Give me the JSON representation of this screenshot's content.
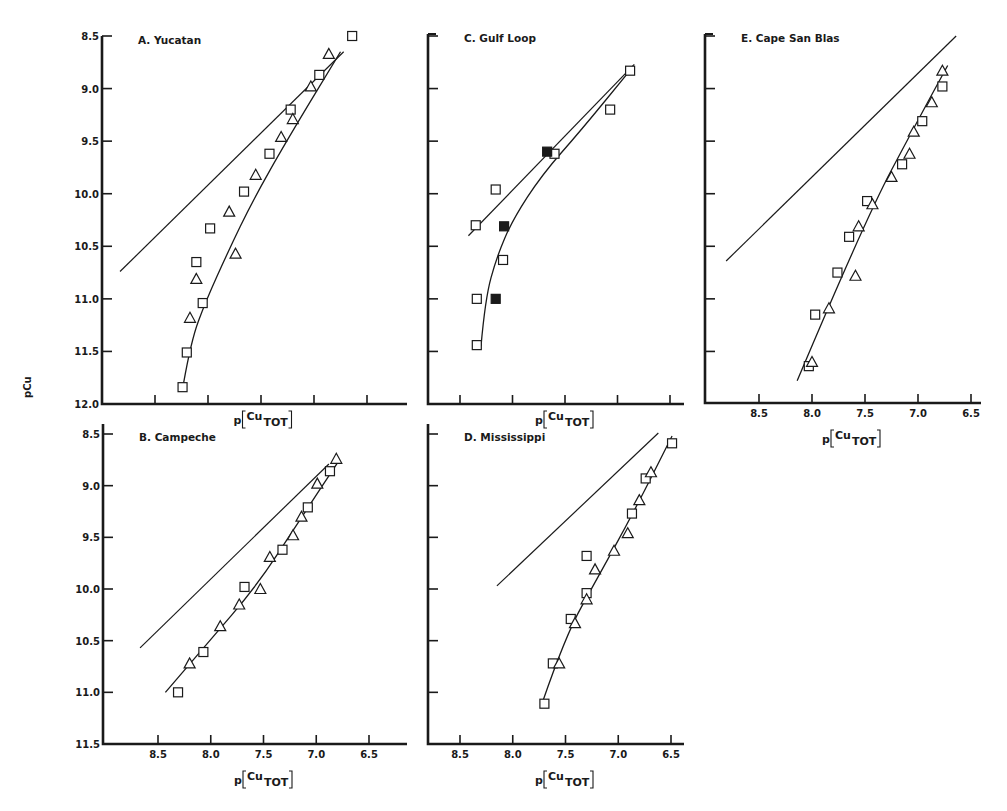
{
  "figure": {
    "shared_ylabel": "pCu",
    "xlabel_prefix": "p",
    "xlabel_main": "Cu",
    "xlabel_sub": "TOT"
  },
  "chart_data": [
    {
      "id": "A",
      "type": "scatter",
      "title": "A. Yucatan",
      "xlabel": "p[Cu_TOT]",
      "ylabel": "pCu",
      "x_reversed": true,
      "y_reversed": true,
      "xlim": [
        9.0,
        6.1
      ],
      "ylim": [
        8.5,
        12.0
      ],
      "xticks": [
        8.5,
        8.0,
        7.5,
        7.0,
        6.5
      ],
      "xtick_labels_shown": false,
      "yticks": [
        "8.5",
        "9.0",
        "9.5",
        "10.0",
        "10.5",
        "11.0",
        "11.5",
        "12.0"
      ],
      "ytick_labels_shown": true,
      "series": [
        {
          "name": "squares",
          "marker": "open-square",
          "points": [
            [
              6.64,
              8.5
            ],
            [
              6.95,
              8.87
            ],
            [
              7.22,
              9.2
            ],
            [
              7.42,
              9.62
            ],
            [
              7.66,
              9.98
            ],
            [
              7.98,
              10.33
            ],
            [
              8.11,
              10.65
            ],
            [
              8.05,
              11.04
            ],
            [
              8.2,
              11.51
            ],
            [
              8.24,
              11.84
            ]
          ]
        },
        {
          "name": "triangles",
          "marker": "open-triangle",
          "points": [
            [
              6.86,
              8.67
            ],
            [
              7.03,
              8.98
            ],
            [
              7.2,
              9.29
            ],
            [
              7.31,
              9.46
            ],
            [
              7.55,
              9.82
            ],
            [
              7.8,
              10.17
            ],
            [
              7.74,
              10.57
            ],
            [
              8.11,
              10.81
            ],
            [
              8.17,
              11.18
            ]
          ]
        }
      ],
      "lines": [
        {
          "name": "reference-line",
          "points": [
            [
              8.83,
              10.74
            ],
            [
              6.72,
              8.65
            ]
          ]
        },
        {
          "name": "fit-curve",
          "points": [
            [
              8.23,
              11.8
            ],
            [
              8.16,
              11.4
            ],
            [
              8.02,
              11.02
            ],
            [
              7.81,
              10.55
            ],
            [
              7.58,
              10.07
            ],
            [
              7.26,
              9.5
            ],
            [
              6.75,
              8.65
            ]
          ]
        }
      ]
    },
    {
      "id": "B",
      "type": "scatter",
      "title": "B. Campeche",
      "xlabel": "p[Cu_TOT]",
      "ylabel": "pCu",
      "x_reversed": true,
      "y_reversed": true,
      "xlim": [
        9.0,
        6.1
      ],
      "ylim": [
        8.5,
        11.5
      ],
      "xticks": [
        "8.5",
        "8.0",
        "7.5",
        "7.0",
        "6.5"
      ],
      "xtick_labels_shown": true,
      "yticks": [
        "8.5",
        "9.0",
        "9.5",
        "10.0",
        "10.5",
        "11.0",
        "11.5"
      ],
      "ytick_labels_shown": true,
      "series": [
        {
          "name": "squares",
          "marker": "open-square",
          "points": [
            [
              6.87,
              8.86
            ],
            [
              7.08,
              9.21
            ],
            [
              7.32,
              9.62
            ],
            [
              7.68,
              9.98
            ],
            [
              8.07,
              10.61
            ],
            [
              8.31,
              11.0
            ]
          ]
        },
        {
          "name": "triangles",
          "marker": "open-triangle",
          "points": [
            [
              6.81,
              8.74
            ],
            [
              6.99,
              8.98
            ],
            [
              7.14,
              9.3
            ],
            [
              7.22,
              9.48
            ],
            [
              7.44,
              9.69
            ],
            [
              7.53,
              10.0
            ],
            [
              7.73,
              10.15
            ],
            [
              7.91,
              10.36
            ],
            [
              8.2,
              10.72
            ]
          ]
        }
      ],
      "lines": [
        {
          "name": "reference-line",
          "points": [
            [
              8.67,
              10.57
            ],
            [
              6.88,
              8.79
            ]
          ]
        },
        {
          "name": "fit-curve",
          "points": [
            [
              8.43,
              11.0
            ],
            [
              8.05,
              10.55
            ],
            [
              7.55,
              9.95
            ],
            [
              7.2,
              9.4
            ],
            [
              6.78,
              8.75
            ]
          ]
        }
      ]
    },
    {
      "id": "C",
      "type": "scatter",
      "title": "C. Gulf Loop",
      "xlabel": "p[Cu_TOT]",
      "ylabel": "pCu",
      "x_reversed": true,
      "y_reversed": true,
      "xlim": [
        8.8,
        6.3
      ],
      "ylim": [
        8.5,
        12.0
      ],
      "xticks": [
        8.5,
        8.0,
        7.5,
        7.0,
        6.5
      ],
      "xtick_labels_shown": false,
      "yticks": [
        8.5,
        9.0,
        9.5,
        10.0,
        10.5,
        11.0,
        11.5,
        12.0
      ],
      "ytick_labels_shown": false,
      "series": [
        {
          "name": "open-squares",
          "marker": "open-square",
          "points": [
            [
              6.88,
              8.83
            ],
            [
              7.07,
              9.2
            ],
            [
              7.6,
              9.62
            ],
            [
              8.16,
              9.96
            ],
            [
              8.35,
              10.3
            ],
            [
              8.09,
              10.63
            ],
            [
              8.34,
              11.0
            ],
            [
              8.34,
              11.44
            ]
          ]
        },
        {
          "name": "filled-squares",
          "marker": "filled-square",
          "points": [
            [
              7.67,
              9.6
            ],
            [
              8.08,
              10.31
            ],
            [
              8.16,
              11.0
            ]
          ]
        }
      ],
      "lines": [
        {
          "name": "reference-line",
          "points": [
            [
              8.42,
              10.4
            ],
            [
              6.84,
              8.77
            ]
          ]
        },
        {
          "name": "fit-curve",
          "points": [
            [
              8.3,
              11.45
            ],
            [
              8.26,
              11.0
            ],
            [
              8.15,
              10.6
            ],
            [
              8.0,
              10.25
            ],
            [
              7.72,
              9.82
            ],
            [
              7.35,
              9.4
            ],
            [
              6.9,
              8.85
            ]
          ]
        }
      ]
    },
    {
      "id": "D",
      "type": "scatter",
      "title": "D. Mississippi",
      "xlabel": "p[Cu_TOT]",
      "ylabel": "pCu",
      "x_reversed": true,
      "y_reversed": true,
      "xlim": [
        8.8,
        6.3
      ],
      "ylim": [
        8.5,
        11.5
      ],
      "xticks": [
        "8.5",
        "8.0",
        "7.5",
        "7.0",
        "6.5"
      ],
      "xtick_labels_shown": true,
      "yticks": [
        8.5,
        9.0,
        9.5,
        10.0,
        10.5,
        11.0,
        11.5
      ],
      "ytick_labels_shown": false,
      "series": [
        {
          "name": "squares",
          "marker": "open-square",
          "points": [
            [
              6.49,
              8.59
            ],
            [
              6.74,
              8.93
            ],
            [
              6.87,
              9.27
            ],
            [
              7.3,
              9.68
            ],
            [
              7.3,
              10.04
            ],
            [
              7.45,
              10.29
            ],
            [
              7.62,
              10.72
            ],
            [
              7.7,
              11.11
            ]
          ]
        },
        {
          "name": "triangles",
          "marker": "open-triangle",
          "points": [
            [
              6.69,
              8.87
            ],
            [
              6.8,
              9.14
            ],
            [
              6.91,
              9.46
            ],
            [
              7.04,
              9.63
            ],
            [
              7.22,
              9.81
            ],
            [
              7.3,
              10.1
            ],
            [
              7.41,
              10.33
            ],
            [
              7.56,
              10.72
            ]
          ]
        }
      ],
      "lines": [
        {
          "name": "reference-line",
          "points": [
            [
              8.15,
              9.97
            ],
            [
              6.62,
              8.49
            ]
          ]
        },
        {
          "name": "fit-curve",
          "points": [
            [
              7.72,
              11.1
            ],
            [
              7.5,
              10.45
            ],
            [
              7.2,
              9.9
            ],
            [
              6.85,
              9.25
            ],
            [
              6.49,
              8.52
            ]
          ]
        }
      ]
    },
    {
      "id": "E",
      "type": "scatter",
      "title": "E. Cape San Blas",
      "xlabel": "p[Cu_TOT]",
      "ylabel": "pCu",
      "x_reversed": true,
      "y_reversed": true,
      "xlim": [
        9.0,
        6.3
      ],
      "ylim": [
        8.5,
        12.0
      ],
      "xticks": [
        "8.5",
        "8.0",
        "7.5",
        "7.0",
        "6.5"
      ],
      "xtick_labels_shown": true,
      "yticks": [
        8.5,
        9.0,
        9.5,
        10.0,
        10.5,
        11.0,
        11.5,
        12.0
      ],
      "ytick_labels_shown": false,
      "series": [
        {
          "name": "squares",
          "marker": "open-square",
          "points": [
            [
              6.77,
              8.98
            ],
            [
              6.96,
              9.31
            ],
            [
              7.15,
              9.72
            ],
            [
              7.48,
              10.07
            ],
            [
              7.65,
              10.41
            ],
            [
              7.76,
              10.75
            ],
            [
              7.97,
              11.15
            ],
            [
              8.03,
              11.64
            ]
          ]
        },
        {
          "name": "triangles",
          "marker": "open-triangle",
          "points": [
            [
              6.77,
              8.83
            ],
            [
              6.87,
              9.13
            ],
            [
              7.04,
              9.41
            ],
            [
              7.08,
              9.62
            ],
            [
              7.25,
              9.84
            ],
            [
              7.43,
              10.1
            ],
            [
              7.56,
              10.31
            ],
            [
              7.59,
              10.78
            ],
            [
              7.84,
              11.09
            ],
            [
              8.0,
              11.6
            ]
          ]
        }
      ],
      "lines": [
        {
          "name": "reference-line",
          "points": [
            [
              8.81,
              10.64
            ],
            [
              6.64,
              8.5
            ]
          ]
        },
        {
          "name": "fit-curve",
          "points": [
            [
              8.14,
              11.78
            ],
            [
              7.5,
              10.25
            ],
            [
              7.0,
              9.3
            ],
            [
              6.72,
              8.78
            ]
          ]
        }
      ]
    }
  ],
  "panels_layout": {
    "A": {
      "left": 102,
      "bottom": 404,
      "top": 36,
      "right": 407,
      "xpx": [
        [
          8.5,
          155
        ],
        [
          6.5,
          367
        ]
      ],
      "ypx": [
        [
          8.5,
          36
        ],
        [
          12.0,
          404
        ]
      ]
    },
    "B": {
      "left": 103,
      "bottom": 744,
      "top": 424,
      "right": 407,
      "xpx": [
        [
          8.5,
          158
        ],
        [
          6.5,
          369
        ]
      ],
      "ypx": [
        [
          8.5,
          434
        ],
        [
          11.5,
          744
        ]
      ]
    },
    "C": {
      "left": 428,
      "bottom": 404,
      "top": 34,
      "right": 684,
      "xpx": [
        [
          8.5,
          460
        ],
        [
          6.5,
          670
        ]
      ],
      "ypx": [
        [
          8.5,
          36
        ],
        [
          12.0,
          404
        ]
      ]
    },
    "D": {
      "left": 428,
      "bottom": 744,
      "top": 424,
      "right": 684,
      "xpx": [
        [
          8.5,
          460
        ],
        [
          6.5,
          671
        ]
      ],
      "ypx": [
        [
          8.5,
          434
        ],
        [
          11.5,
          744
        ]
      ]
    },
    "E": {
      "left": 705,
      "bottom": 403,
      "top": 34,
      "right": 981,
      "xpx": [
        [
          8.5,
          759
        ],
        [
          6.5,
          971
        ]
      ],
      "ypx": [
        [
          8.5,
          36
        ],
        [
          12.0,
          404
        ]
      ]
    }
  }
}
